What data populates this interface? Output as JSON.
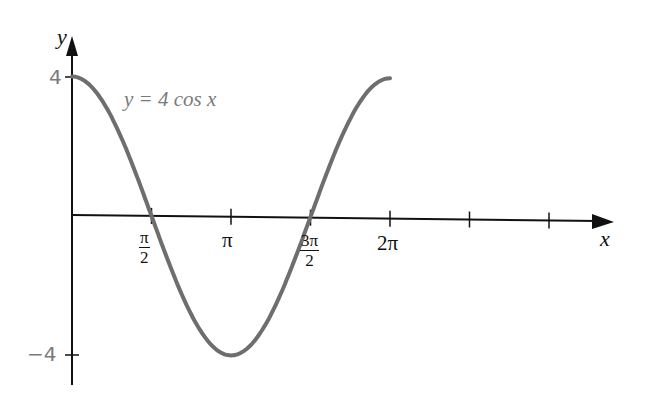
{
  "chart_data": {
    "type": "line",
    "title": "",
    "xlabel": "x",
    "ylabel": "y",
    "function": "y = 4 cos x",
    "curve_label": "y = 4 cos x",
    "x_ticks": [
      {
        "value": 1.5708,
        "label_num": "π",
        "label_den": "2"
      },
      {
        "value": 3.1416,
        "label": "π"
      },
      {
        "value": 4.7124,
        "label_num": "3π",
        "label_den": "2"
      },
      {
        "value": 6.2832,
        "label": "2π"
      },
      {
        "value": 7.854,
        "label": ""
      },
      {
        "value": 9.4248,
        "label": ""
      }
    ],
    "y_ticks": [
      {
        "value": 4,
        "label": "4"
      },
      {
        "value": -4,
        "label": "−4"
      }
    ],
    "xlim": [
      0,
      11
    ],
    "ylim": [
      -4.6,
      5
    ],
    "grid": false,
    "legend": "none",
    "series": [
      {
        "name": "y = 4 cos x",
        "color": "#6e6e6e",
        "x": [
          0,
          0.7854,
          1.5708,
          2.3562,
          3.1416,
          3.927,
          4.7124,
          5.4978,
          6.2832
        ],
        "y": [
          4,
          2.83,
          0,
          -2.83,
          -4,
          -2.83,
          0,
          2.83,
          4
        ]
      }
    ]
  },
  "labels": {
    "y_axis": "y",
    "x_axis": "x",
    "y_tick_4": "4",
    "y_tick_neg4": "−4",
    "curve_eq": "y = 4 cos x",
    "x_tick_pi_over_2_num": "π",
    "x_tick_pi_over_2_den": "2",
    "x_tick_pi": "π",
    "x_tick_3pi_over_2_num": "3π",
    "x_tick_3pi_over_2_den": "2",
    "x_tick_2pi": "2π"
  }
}
